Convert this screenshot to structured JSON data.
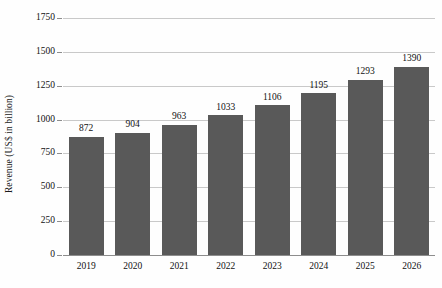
{
  "chart_data": {
    "type": "bar",
    "title": "",
    "subtitle": "",
    "xlabel": "",
    "ylabel": "Revenue (US$ in billion)",
    "categories": [
      "2019",
      "2020",
      "2021",
      "2022",
      "2023",
      "2024",
      "2025",
      "2026"
    ],
    "values": [
      872,
      904,
      963,
      1033,
      1106,
      1195,
      1293,
      1390
    ],
    "data_labels": [
      "872",
      "904",
      "963",
      "1033",
      "1106",
      "1195",
      "1293",
      "1390"
    ],
    "ylim": [
      0,
      1750
    ],
    "y_ticks": [
      0,
      250,
      500,
      750,
      1000,
      1250,
      1500,
      1750
    ],
    "y_tick_labels": [
      "0",
      "250",
      "500",
      "750",
      "1000",
      "1250",
      "1500",
      "1750"
    ],
    "grid": true,
    "grid_axis": "y",
    "legend": false,
    "legend_position": "none",
    "series": [
      {
        "name": "Revenue",
        "values": [
          872,
          904,
          963,
          1033,
          1106,
          1195,
          1293,
          1390
        ]
      }
    ]
  },
  "style": {
    "bar_color": "#595959",
    "grid_color": "#c9c9c9",
    "axis_color": "#8d8d8d",
    "text_color": "#111111",
    "background": "#fefefe"
  }
}
